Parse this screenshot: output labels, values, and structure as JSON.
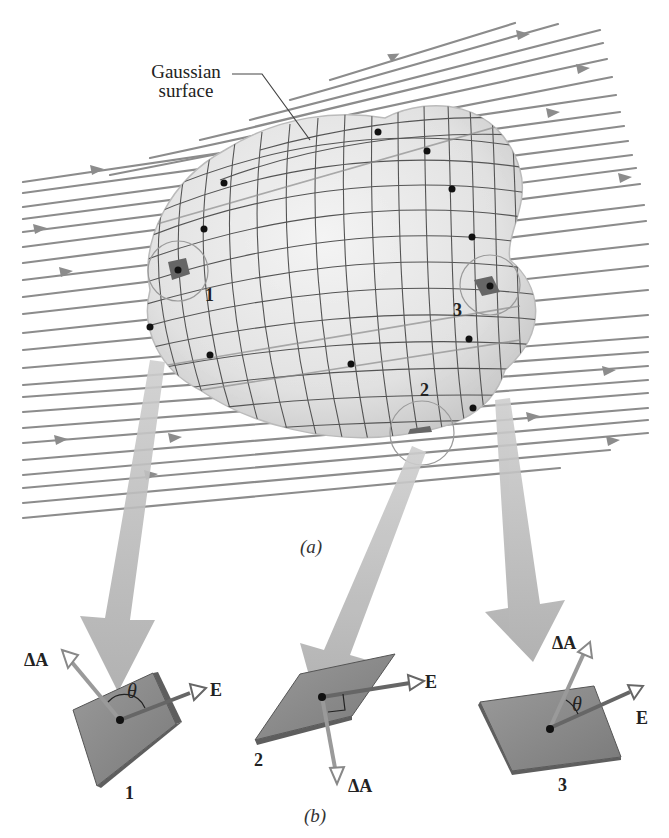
{
  "figure": {
    "part_a": {
      "caption": "(a)",
      "callout_label_line1": "Gaussian",
      "callout_label_line2": "surface",
      "patch_labels": [
        "1",
        "2",
        "3"
      ]
    },
    "part_b": {
      "caption": "(b)",
      "elements": [
        {
          "id": "1",
          "number_label": "1",
          "normal_label": "ΔA",
          "field_label": "E",
          "angle_label": "θ",
          "angle_relation": "obtuse"
        },
        {
          "id": "2",
          "number_label": "2",
          "normal_label": "ΔA",
          "field_label": "E",
          "angle_label": "",
          "angle_relation": "right-angle"
        },
        {
          "id": "3",
          "number_label": "3",
          "normal_label": "ΔA",
          "field_label": "E",
          "angle_label": "θ",
          "angle_relation": "acute"
        }
      ]
    },
    "colors": {
      "field_line": "#8a8a8a",
      "surface_fill": "#e6e6e6",
      "grid_line": "#555555",
      "patch_fill": "#6e6e6e",
      "big_arrow": "#bdbdbd",
      "plate_fill": "#8c8c8c",
      "text": "#222222"
    }
  }
}
